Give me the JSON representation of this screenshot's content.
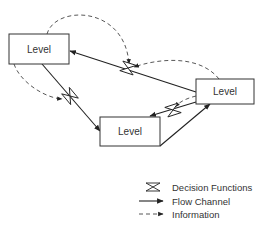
{
  "diagram": {
    "type": "system-dynamics flow diagram",
    "nodes": [
      {
        "id": "level-top-left",
        "label": "Level"
      },
      {
        "id": "level-bottom",
        "label": "Level"
      },
      {
        "id": "level-right",
        "label": "Level"
      }
    ],
    "legend": {
      "items": [
        {
          "symbol": "decision-function-icon",
          "label": "Decision Functions"
        },
        {
          "symbol": "solid-arrow",
          "label": "Flow Channel"
        },
        {
          "symbol": "dashed-arrow",
          "label": "Information"
        }
      ]
    },
    "colors": {
      "line": "#222222",
      "box_border": "#333333",
      "background": "#ffffff"
    }
  }
}
